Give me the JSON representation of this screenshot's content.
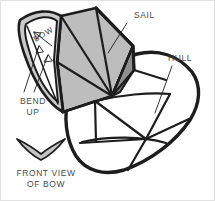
{
  "figure": {
    "background_color": "#ffffff",
    "frame_color": "#e2e2e2",
    "ink_color": "#1d1d1d",
    "text_color": "#4a4a4a",
    "sail_fill_light": "#bdbdbd",
    "sail_fill_mid": "#a8a8a8",
    "sail_fill_dark": "#8f8f8f",
    "bow_fill": "#c9c9c9",
    "hull_fill": "#ffffff",
    "width": 215,
    "height": 201
  },
  "labels": {
    "sail": "SAIL",
    "hull": "HULL",
    "bow": "BOW",
    "bend_up": "BEND\nUP",
    "front_view": "FRONT VIEW\nOF BOW"
  },
  "parts": [
    {
      "name": "sail",
      "label": "SAIL"
    },
    {
      "name": "hull",
      "label": "HULL"
    },
    {
      "name": "bow",
      "label": "BOW"
    }
  ],
  "annotations": [
    {
      "name": "bend-up-instruction",
      "text": "BEND UP"
    },
    {
      "name": "front-view-caption",
      "text": "FRONT VIEW OF BOW"
    }
  ]
}
